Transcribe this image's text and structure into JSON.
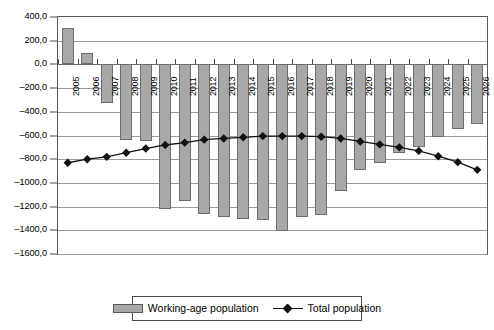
{
  "chart_data": {
    "type": "bar",
    "title": "",
    "xlabel": "",
    "ylabel": "",
    "ylim": [
      -1600.0,
      400.0
    ],
    "ytick_step": 200.0,
    "ytick_labels": [
      "400,0",
      "200,0",
      "0,0",
      "-200,0",
      "-400,0",
      "-600,0",
      "-800,0",
      "-1000,0",
      "-1200,0",
      "-1400,0",
      "-1600,0"
    ],
    "ytick_values": [
      400.0,
      200.0,
      0.0,
      -200.0,
      -400.0,
      -600.0,
      -800.0,
      -1000.0,
      -1200.0,
      -1400.0,
      -1600.0
    ],
    "grid": true,
    "legend_position": "bottom",
    "decimal_separator": ",",
    "categories": [
      "2005",
      "2006",
      "2007",
      "2008",
      "2009",
      "2010",
      "2011",
      "2012",
      "2013",
      "2014",
      "2015",
      "2016",
      "2017",
      "2018",
      "2019",
      "2020",
      "2021",
      "2022",
      "2023",
      "2024",
      "2025",
      "2026"
    ],
    "series": [
      {
        "name": "Working-age population",
        "type": "bar",
        "color": "#a8a8a8",
        "edge_color": "#6d6d6d",
        "values": [
          310,
          100,
          -330,
          -640,
          -650,
          -1220,
          -1155,
          -1265,
          -1290,
          -1305,
          -1310,
          -1405,
          -1290,
          -1270,
          -1065,
          -890,
          -830,
          -745,
          -700,
          -615,
          -545,
          -500
        ]
      },
      {
        "name": "Total population",
        "type": "line",
        "color": "#111111",
        "marker": "diamond",
        "values": [
          -830,
          -800,
          -780,
          -745,
          -710,
          -680,
          -660,
          -635,
          -625,
          -615,
          -605,
          -605,
          -605,
          -610,
          -625,
          -650,
          -675,
          -700,
          -730,
          -775,
          -825,
          -890
        ]
      }
    ]
  },
  "legend": {
    "items": [
      {
        "label": "Working-age population",
        "marker": "bar-swatch"
      },
      {
        "label": "Total population",
        "marker": "line-diamond"
      }
    ]
  }
}
